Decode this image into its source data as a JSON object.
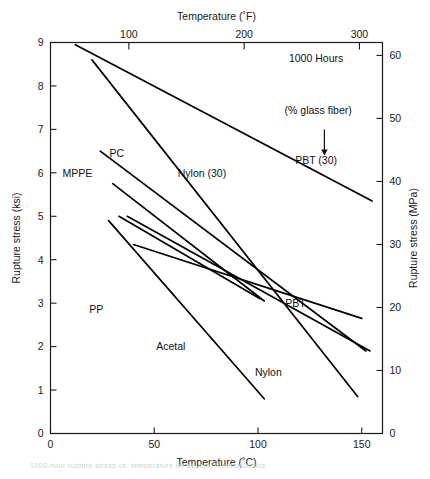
{
  "figure": {
    "background": "#ffffff",
    "line_color": "#000000",
    "axis_color": "#1a1a1a"
  },
  "caption": {
    "text": "1000-hour rupture stress vs. temperature for several thermoplastics"
  },
  "chart_data": {
    "type": "line",
    "title": "",
    "subtitle": "",
    "xlabel": "Temperature (˚C)",
    "ylabel": "Rupture stress (ksi)",
    "xlabel_top": "Temperature (˚F)",
    "ylabel_right": "Rupture stress (MPa)",
    "xlim": [
      0,
      160
    ],
    "ylim": [
      0,
      9
    ],
    "xlim_top_F": [
      32,
      320
    ],
    "ylim_right_MPa": [
      0,
      62.05
    ],
    "grid": false,
    "legend": "inline-labels",
    "xticks": [
      0,
      50,
      100,
      150
    ],
    "xtick_labels": [
      "0",
      "50",
      "100",
      "150"
    ],
    "xticks_top_F": [
      100,
      200,
      300
    ],
    "xtick_labels_top": [
      "100",
      "200",
      "300"
    ],
    "yticks": [
      0,
      1,
      2,
      3,
      4,
      5,
      6,
      7,
      8,
      9
    ],
    "ytick_labels": [
      "0",
      "1",
      "2",
      "3",
      "4",
      "5",
      "6",
      "7",
      "8",
      "9"
    ],
    "yticks_right_MPa": [
      0,
      10,
      20,
      30,
      40,
      50,
      60
    ],
    "ytick_labels_right": [
      "0",
      "10",
      "20",
      "30",
      "40",
      "50",
      "60"
    ],
    "annotations": [
      {
        "name": "hours-note",
        "text": "1000 Hours",
        "x": 128,
        "y": 8.55
      },
      {
        "name": "glass-fiber-note",
        "text": "(% glass fiber)",
        "x": 129,
        "y": 7.35
      },
      {
        "name": "arrow-glass-fiber",
        "text": "",
        "x": 132,
        "y": 7.0
      }
    ],
    "series": [
      {
        "name": "PBT (30)",
        "label": "PBT (30)",
        "label_x": 128,
        "label_y": 6.3,
        "points": [
          {
            "x": 12,
            "y": 8.95
          },
          {
            "x": 155,
            "y": 5.35
          }
        ]
      },
      {
        "name": "Nylon (30)",
        "label": "Nylon (30)",
        "label_x": 73,
        "label_y": 6.0,
        "points": [
          {
            "x": 20,
            "y": 8.6
          },
          {
            "x": 148,
            "y": 0.85
          }
        ]
      },
      {
        "name": "PC",
        "label": "PC",
        "label_x": 32,
        "label_y": 6.45,
        "points": [
          {
            "x": 24,
            "y": 6.5
          },
          {
            "x": 152,
            "y": 1.9
          }
        ]
      },
      {
        "name": "MPPE",
        "label": "MPPE",
        "label_x": 13,
        "label_y": 6.0,
        "points": [
          {
            "x": 30,
            "y": 5.75
          },
          {
            "x": 103,
            "y": 3.05
          }
        ]
      },
      {
        "name": "PP",
        "label": "PP",
        "label_x": 22,
        "label_y": 2.85,
        "points": [
          {
            "x": 33,
            "y": 5.0
          },
          {
            "x": 101,
            "y": 3.1
          }
        ]
      },
      {
        "name": "Acetal",
        "label": "Acetal",
        "label_x": 58,
        "label_y": 2.0,
        "points": [
          {
            "x": 28,
            "y": 4.9
          },
          {
            "x": 103,
            "y": 0.8
          }
        ]
      },
      {
        "name": "Nylon",
        "label": "Nylon",
        "label_x": 105,
        "label_y": 1.4,
        "points": [
          {
            "x": 37,
            "y": 5.0
          },
          {
            "x": 154,
            "y": 1.9
          }
        ]
      },
      {
        "name": "PBT",
        "label": "PBT",
        "label_x": 118,
        "label_y": 3.0,
        "points": [
          {
            "x": 40,
            "y": 4.35
          },
          {
            "x": 150,
            "y": 2.65
          }
        ]
      }
    ]
  }
}
